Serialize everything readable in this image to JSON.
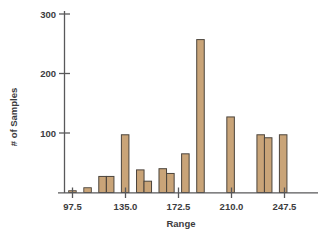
{
  "chart_data": {
    "type": "bar",
    "title": "",
    "subtitle": "",
    "xlabel": "Range",
    "ylabel": "# of Samples",
    "xlim": [
      92.2,
      255.5
    ],
    "ylim": [
      0,
      310
    ],
    "grid": false,
    "legend": null,
    "xticks": [
      "97.5",
      "135.0",
      "172.5",
      "210.0",
      "247.5"
    ],
    "xtick_values": [
      97.5,
      135.0,
      172.5,
      210.0,
      247.5
    ],
    "yticks": [
      "100",
      "200",
      "300"
    ],
    "ytick_values": [
      100,
      200,
      300
    ],
    "bin_width": 5.33,
    "categories": [
      "94.8",
      "100.2",
      "105.5",
      "110.8",
      "116.1",
      "121.5",
      "126.8",
      "132.1",
      "137.4",
      "142.8",
      "148.1",
      "153.4",
      "158.7",
      "164.1",
      "169.4",
      "174.7",
      "180.0",
      "185.4",
      "190.7",
      "196.0",
      "201.3",
      "206.7",
      "212.0",
      "217.3",
      "222.6",
      "228.0",
      "233.3",
      "238.6",
      "243.9"
    ],
    "values": [
      3,
      0,
      8,
      0,
      27,
      27,
      0,
      97,
      0,
      38,
      19,
      0,
      40,
      32,
      0,
      65,
      0,
      257,
      0,
      0,
      0,
      127,
      0,
      0,
      0,
      97,
      92,
      0,
      97
    ],
    "bar_color": "#c9a478",
    "bar_edge_color": "#4b443c",
    "axis_color": "#58585a"
  }
}
